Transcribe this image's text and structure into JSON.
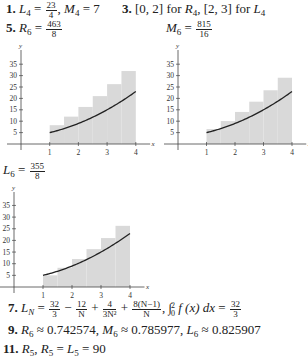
{
  "answers": {
    "a1": {
      "number": "1.",
      "L4_label": "L",
      "L4_sub": "4",
      "L4_num": "23",
      "L4_den": "4",
      "M4_label": "M",
      "M4_sub": "4",
      "M4_val": "7"
    },
    "a3": {
      "number": "3.",
      "text1": "[0, 2] for ",
      "R_sub": "4",
      "text2": ", [2, 3] for ",
      "L_sub": "4"
    },
    "a5": {
      "number": "5.",
      "R6_num": "463",
      "R6_den": "8",
      "M6_num": "815",
      "M6_den": "16",
      "L6_num": "355",
      "L6_den": "8"
    },
    "a7": {
      "number": "7.",
      "t1_num": "32",
      "t1_den": "3",
      "t2_num": "12",
      "t2_den": "N",
      "t3_num": "4",
      "t3_den": "3N²",
      "t4_num": "8(N−1)",
      "t4_den": "N",
      "integral_upper": "2",
      "integral_lower": "0",
      "integrand": "f (x) dx",
      "result_num": "32",
      "result_den": "3"
    },
    "a9": {
      "number": "9.",
      "R6": "0.742574",
      "M6": "0.785977",
      "L6": "0.825907"
    },
    "a11": {
      "number": "11.",
      "value": "90"
    }
  },
  "chart_data": [
    {
      "type": "bar",
      "title": "R6 = 463/8 (right-endpoint rectangles)",
      "xlabel": "x",
      "ylabel": "y",
      "x_ticks": [
        1,
        2,
        3,
        4
      ],
      "y_ticks": [
        5,
        10,
        15,
        20,
        25,
        30,
        35
      ],
      "xlim": [
        0,
        4.4
      ],
      "ylim": [
        0,
        38
      ],
      "rect_width": 0.5,
      "rect_left_edges": [
        1,
        1.5,
        2,
        2.5,
        3,
        3.5
      ],
      "values": [
        8.25,
        12,
        16.25,
        21,
        26.25,
        32
      ],
      "curve": {
        "name": "f(x) = x² + x + 3",
        "x_range": [
          1,
          4
        ]
      },
      "fill_color": "#d9d9d9",
      "curve_color": "#222222"
    },
    {
      "type": "bar",
      "title": "M6 = 815/16 (midpoint rectangles)",
      "xlabel": "x",
      "ylabel": "y",
      "x_ticks": [
        1,
        2,
        3,
        4
      ],
      "y_ticks": [
        5,
        10,
        15,
        20,
        25,
        30,
        35
      ],
      "xlim": [
        0,
        4.4
      ],
      "ylim": [
        0,
        38
      ],
      "rect_width": 0.5,
      "rect_left_edges": [
        1,
        1.5,
        2,
        2.5,
        3,
        3.5
      ],
      "values": [
        6.56,
        10.06,
        14.06,
        18.56,
        23.56,
        29.06
      ],
      "curve": {
        "name": "f(x) = x² + x + 3",
        "x_range": [
          1,
          4
        ]
      },
      "fill_color": "#d9d9d9",
      "curve_color": "#222222"
    },
    {
      "type": "bar",
      "title": "L6 = 355/8 (left-endpoint rectangles)",
      "xlabel": "x",
      "ylabel": "y",
      "x_ticks": [
        1,
        2,
        3,
        4
      ],
      "y_ticks": [
        5,
        10,
        15,
        20,
        25,
        30,
        35
      ],
      "xlim": [
        0,
        4.4
      ],
      "ylim": [
        0,
        38
      ],
      "rect_width": 0.5,
      "rect_left_edges": [
        1,
        1.5,
        2,
        2.5,
        3,
        3.5
      ],
      "values": [
        5,
        8.25,
        12,
        16.25,
        21,
        26.25
      ],
      "curve": {
        "name": "f(x) = x² + x + 3",
        "x_range": [
          1,
          4
        ]
      },
      "fill_color": "#d9d9d9",
      "curve_color": "#222222"
    }
  ]
}
